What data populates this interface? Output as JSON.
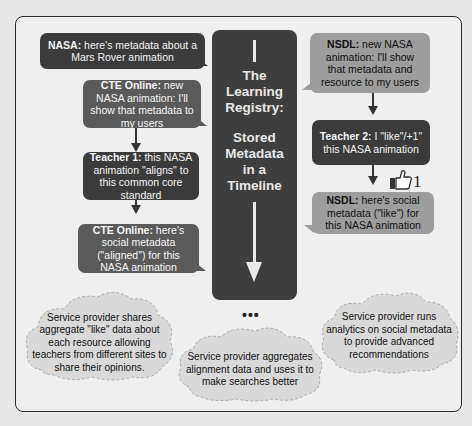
{
  "center": {
    "title_lines": [
      "The",
      "Learning",
      "Registry:"
    ],
    "subtitle_lines": [
      "Stored",
      "Metadata",
      "in a",
      "Timeline"
    ]
  },
  "left_bubbles": [
    {
      "speaker": "NASA:",
      "text": " here's metadata about a Mars Rover animation"
    },
    {
      "speaker": "CTE Online:",
      "text": " new NASA animation: I'll show that metadata to my users"
    },
    {
      "speaker": "Teacher 1:",
      "text": " this NASA animation \"aligns\" to this common core standard"
    },
    {
      "speaker": "CTE Online:",
      "text": " here's social metadata (\"aligned\") for this NASA animation"
    }
  ],
  "right_bubbles": [
    {
      "speaker": "NSDL:",
      "text": " new NASA animation: I'll show that metadata and resource to my users"
    },
    {
      "speaker": "Teacher 2:",
      "text": " I \"like\"/+1\" this NASA animation"
    },
    {
      "speaker": "NSDL:",
      "text": " here's social metadata (\"like\") for this NASA animation"
    }
  ],
  "like_badge": {
    "icon": "thumbs-up-icon",
    "count": "1"
  },
  "ellipsis": "•••",
  "clouds": [
    {
      "text": "Service provider shares aggregate \"like\" data about each resource allowing teachers from different sites to share their opinions."
    },
    {
      "text": "Service provider aggregates alignment data and uses it to make searches better"
    },
    {
      "text": "Service provider runs analytics on social metadata to provide advanced recommendations"
    }
  ],
  "colors": {
    "dark_bubble": "#3b3b3b",
    "mid_bubble": "#5a5a5a",
    "light_bubble": "#9d9d9d",
    "center_panel": "#3e3e3e",
    "cloud_fill": "#d9d9d9"
  }
}
